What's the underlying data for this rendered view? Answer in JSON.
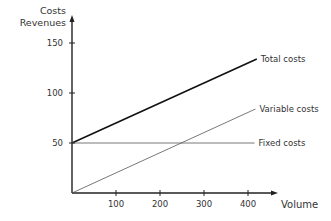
{
  "chart_data": {
    "type": "line",
    "title": "",
    "xlabel": "Volume",
    "ylabel": "Costs Revenues",
    "ylabel_lines": [
      "Costs",
      "Revenues"
    ],
    "xlim": [
      0,
      430
    ],
    "ylim": [
      0,
      170
    ],
    "x_ticks": [
      100,
      200,
      300,
      400
    ],
    "y_ticks": [
      50,
      100,
      150
    ],
    "grid": false,
    "legend_position": "inline-right",
    "series": [
      {
        "name": "Total costs",
        "x": [
          0,
          420
        ],
        "values": [
          50,
          134
        ],
        "color": "#111111",
        "stroke_width": 1.6
      },
      {
        "name": "Variable costs",
        "x": [
          0,
          417
        ],
        "values": [
          0,
          84
        ],
        "color": "#555555",
        "stroke_width": 0.8
      },
      {
        "name": "Fixed costs",
        "x": [
          0,
          415
        ],
        "values": [
          50,
          50
        ],
        "color": "#555555",
        "stroke_width": 0.8
      }
    ]
  }
}
